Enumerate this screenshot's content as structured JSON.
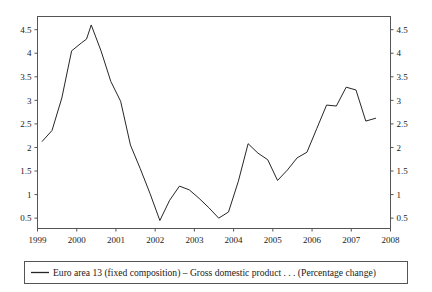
{
  "chart_data": {
    "type": "line",
    "title": "",
    "xlabel": "",
    "ylabel": "",
    "xlim": [
      1999.0,
      2008.0
    ],
    "ylim": [
      0.28,
      4.78
    ],
    "grid": false,
    "legend_position": "below",
    "x_tick_labels": [
      "1999",
      "2000",
      "2001",
      "2002",
      "2003",
      "2004",
      "2005",
      "2006",
      "2007",
      "2008"
    ],
    "x_tick_values": [
      1999,
      2000,
      2001,
      2002,
      2003,
      2004,
      2005,
      2006,
      2007,
      2008
    ],
    "y_tick_labels": [
      "0.5",
      "1",
      "1.5",
      "2",
      "2.5",
      "3",
      "3.5",
      "4",
      "4.5"
    ],
    "y_tick_values": [
      0.5,
      1,
      1.5,
      2,
      2.5,
      3,
      3.5,
      4,
      4.5
    ],
    "y_axis_right_labels": [
      "0.5",
      "1",
      "1.5",
      "2",
      "2.5",
      "3",
      "3.5",
      "4",
      "4.5"
    ],
    "series": [
      {
        "name": "Euro area 13 (fixed composition) – Gross domestic product . . . (Percentage change)",
        "color": "#262626",
        "x": [
          1999.12,
          1999.37,
          1999.62,
          1999.87,
          2000.12,
          2000.25,
          2000.37,
          2000.62,
          2000.87,
          2001.12,
          2001.37,
          2001.62,
          2001.87,
          2002.12,
          2002.37,
          2002.62,
          2002.87,
          2003.12,
          2003.37,
          2003.62,
          2003.87,
          2004.12,
          2004.37,
          2004.62,
          2004.87,
          2005.12,
          2005.37,
          2005.62,
          2005.87,
          2006.12,
          2006.37,
          2006.62,
          2006.87,
          2007.12,
          2007.37,
          2007.62
        ],
        "values": [
          2.13,
          2.36,
          3.05,
          4.05,
          4.22,
          4.3,
          4.6,
          4.05,
          3.4,
          2.98,
          2.05,
          1.55,
          1.02,
          0.45,
          0.88,
          1.18,
          1.1,
          0.92,
          0.72,
          0.5,
          0.63,
          1.28,
          2.08,
          1.88,
          1.74,
          1.3,
          1.52,
          1.78,
          1.9,
          2.4,
          2.9,
          2.88,
          3.28,
          3.22,
          2.56,
          2.62
        ]
      }
    ]
  },
  "legend": {
    "entries": [
      {
        "label": "Euro area 13 (fixed composition) – Gross domestic product . . . (Percentage change)",
        "marker": "line-marker",
        "color": "#262626"
      }
    ]
  },
  "colors": {
    "series_line": "#262626",
    "axis": "#555555",
    "text": "#1a1a1a",
    "background": "#ffffff"
  }
}
